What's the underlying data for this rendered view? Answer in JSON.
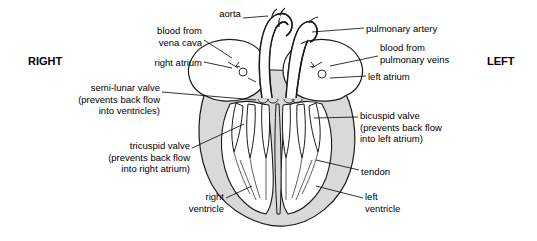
{
  "diagram": {
    "side_labels": {
      "left_side": "RIGHT",
      "right_side": "LEFT"
    },
    "labels": [
      {
        "id": "aorta",
        "text": "aorta",
        "x": 200,
        "y": 8,
        "w": 60,
        "align": "center"
      },
      {
        "id": "blood-vena-cava",
        "text": "blood from\nvena cava",
        "x": 110,
        "y": 25,
        "w": 92,
        "align": "right"
      },
      {
        "id": "right-atrium",
        "text": "right atrium",
        "x": 119,
        "y": 57,
        "w": 83,
        "align": "right"
      },
      {
        "id": "semi-lunar-valve",
        "text": "semi-lunar valve\n(prevents back flow\ninto ventricles)",
        "x": 30,
        "y": 82,
        "w": 130,
        "align": "right"
      },
      {
        "id": "tricuspid-valve",
        "text": "tricuspid valve\n(prevents back flow\ninto right atrium)",
        "x": 55,
        "y": 140,
        "w": 135,
        "align": "right"
      },
      {
        "id": "right-ventricle",
        "text": "right\nventricle",
        "x": 158,
        "y": 191,
        "w": 66,
        "align": "right"
      },
      {
        "id": "pulmonary-artery",
        "text": "pulmonary artery",
        "x": 366,
        "y": 23,
        "w": 110,
        "align": "left"
      },
      {
        "id": "blood-pulmonary-veins",
        "text": "blood from\npulmonary veins",
        "x": 380,
        "y": 42,
        "w": 110,
        "align": "left"
      },
      {
        "id": "left-atrium",
        "text": "left atrium",
        "x": 368,
        "y": 71,
        "w": 80,
        "align": "left"
      },
      {
        "id": "bicuspid-valve",
        "text": "bicuspid valve\n(prevents back flow\ninto left atrium)",
        "x": 360,
        "y": 110,
        "w": 125,
        "align": "left"
      },
      {
        "id": "tendon",
        "text": "tendon",
        "x": 361,
        "y": 166,
        "w": 60,
        "align": "left"
      },
      {
        "id": "left-ventricle",
        "text": "left\nventricle",
        "x": 365,
        "y": 191,
        "w": 60,
        "align": "left"
      }
    ],
    "colors": {
      "outline": "#1a1a1a",
      "heart_fill": "#d9d9d9",
      "chamber_fill": "#ffffff",
      "background": "#ffffff"
    }
  }
}
